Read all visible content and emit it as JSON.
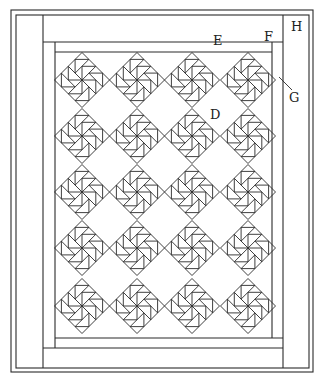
{
  "diagram": {
    "type": "quilt layout",
    "stroke_color": "#2a2a2a",
    "background": "#ffffff",
    "blocks": {
      "rows": 5,
      "columns": 4,
      "style": "pinwheel / flying geese on point"
    },
    "labels": [
      {
        "id": "H",
        "text": "H",
        "x": 291,
        "y": 28
      },
      {
        "id": "E",
        "text": "E",
        "x": 213,
        "y": 37
      },
      {
        "id": "F",
        "text": "F",
        "x": 265,
        "y": 33
      },
      {
        "id": "G",
        "text": "G",
        "x": 290,
        "y": 90
      },
      {
        "id": "D",
        "text": "D",
        "x": 211,
        "y": 112
      }
    ]
  }
}
